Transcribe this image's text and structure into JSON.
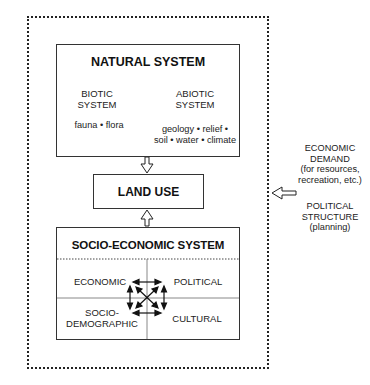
{
  "diagram": {
    "natural_system": {
      "title": "NATURAL SYSTEM",
      "biotic": {
        "label_line1": "BIOTIC",
        "label_line2": "SYSTEM",
        "components": "fauna • flora"
      },
      "abiotic": {
        "label_line1": "ABIOTIC",
        "label_line2": "SYSTEM",
        "components_line1": "geology • relief •",
        "components_line2": "soil • water • climate"
      }
    },
    "land_use": {
      "title": "LAND USE"
    },
    "socio_economic_system": {
      "title": "SOCIO-ECONOMIC SYSTEM",
      "quadrants": {
        "economic": "ECONOMIC",
        "political": "POLITICAL",
        "socio_demographic_line1": "SOCIO-",
        "socio_demographic_line2": "DEMOGRAPHIC",
        "cultural": "CULTURAL"
      }
    },
    "external_influences": {
      "economic_demand_line1": "ECONOMIC",
      "economic_demand_line2": "DEMAND",
      "economic_demand_line3": "(for resources,",
      "economic_demand_line4": "recreation, etc.)",
      "political_structure_line1": "POLITICAL",
      "political_structure_line2": "STRUCTURE",
      "political_structure_line3": "(planning)"
    },
    "colors": {
      "line": "#222222",
      "text": "#1a1a1a",
      "background": "#ffffff"
    }
  }
}
